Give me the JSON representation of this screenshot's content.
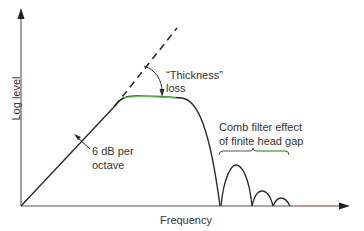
{
  "diagram": {
    "type": "frequency-response-sketch",
    "axes": {
      "x_label": "Frequency",
      "y_label": "Log level"
    },
    "annotations": {
      "slope": [
        "6 dB per",
        "octave"
      ],
      "thickness_loss": [
        "“Thickness”",
        "loss"
      ],
      "comb_filter": [
        "Comb filter effect",
        "of finite head gap"
      ]
    },
    "colors": {
      "line": "#2b2b2b",
      "dashed": "#2b2b2b",
      "text": "#333333",
      "highlight_green": "#5ee04a"
    }
  }
}
